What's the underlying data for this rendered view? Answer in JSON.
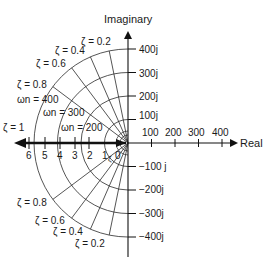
{
  "axes": {
    "imaginary_label": "Imaginary",
    "real_label": "Real",
    "imag_ticks_positive": [
      "100j",
      "200j",
      "300j",
      "400j"
    ],
    "imag_ticks_negative": [
      "−100 j",
      "−200j",
      "−300j",
      "−400j"
    ],
    "real_ticks_positive": [
      "100",
      "200",
      "300",
      "400"
    ],
    "sigma_ticks_negative": [
      "6",
      "5",
      "4",
      "3",
      "2",
      "1",
      "0"
    ]
  },
  "damping_lines": {
    "upper": [
      "ζ = 0.2",
      "ζ = 0.4",
      "ζ = 0.6",
      "ζ = 0.8",
      "ζ = 1"
    ],
    "lower": [
      "ζ = 0.8",
      "ζ = 0.6",
      "ζ = 0.4",
      "ζ = 0.2"
    ],
    "values": [
      0.2,
      0.4,
      0.6,
      0.8,
      1.0
    ]
  },
  "natural_frequency": {
    "labels": [
      "ωn = 400",
      "ωn = 300",
      "ωn = 200"
    ],
    "omega": "ω",
    "sub": "n",
    "values": [
      100,
      200,
      300,
      400
    ]
  },
  "zeta_small_label": "ζ",
  "colors": {
    "ink": "#111111",
    "background": "#ffffff"
  }
}
